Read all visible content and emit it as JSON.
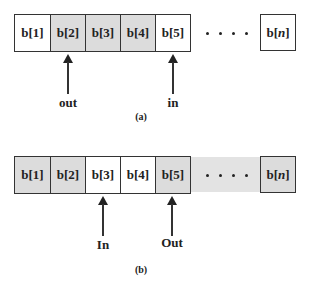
{
  "colors": {
    "filled": "#dcdcdc",
    "empty": "#ffffff",
    "border": "#333333"
  },
  "diagram_a": {
    "caption": "(a)",
    "cells": [
      {
        "label": "b[1]",
        "filled": false
      },
      {
        "label": "b[2]",
        "filled": true
      },
      {
        "label": "b[3]",
        "filled": true
      },
      {
        "label": "b[4]",
        "filled": true
      },
      {
        "label": "b[5]",
        "filled": false
      }
    ],
    "ellipsis": "• • • •",
    "last_cell": {
      "prefix": "b[",
      "var": "n",
      "suffix": "]",
      "filled": false
    },
    "pointers": [
      {
        "label": "out",
        "points_to": "b[2]"
      },
      {
        "label": "in",
        "points_to": "b[5]"
      }
    ]
  },
  "diagram_b": {
    "caption": "(b)",
    "cells": [
      {
        "label": "b[1]",
        "filled": true
      },
      {
        "label": "b[2]",
        "filled": true
      },
      {
        "label": "b[3]",
        "filled": false
      },
      {
        "label": "b[4]",
        "filled": false
      },
      {
        "label": "b[5]",
        "filled": true
      }
    ],
    "ellipsis": "• • • •",
    "last_cell": {
      "prefix": "b[",
      "var": "n",
      "suffix": "]",
      "filled": true
    },
    "pointers": [
      {
        "label": "In",
        "points_to": "b[3]"
      },
      {
        "label": "Out",
        "points_to": "b[5]"
      }
    ]
  }
}
